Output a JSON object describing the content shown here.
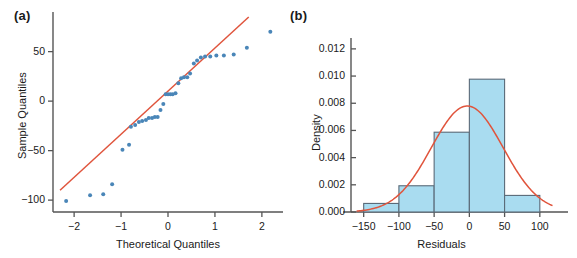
{
  "figure": {
    "background": "#ffffff",
    "panels": [
      {
        "label": "(a)"
      },
      {
        "label": "(b)"
      }
    ]
  },
  "colors": {
    "point": "#4a86b8",
    "line": "#e0543c",
    "bar_fill": "#a9dcf0",
    "bar_stroke": "#5a6a78",
    "axis": "#555555",
    "text": "#1a1a1a"
  },
  "chart_data": [
    {
      "type": "scatter",
      "panel": "(a)",
      "title": "",
      "xlabel": "Theoretical Quantiles",
      "ylabel": "Sample Quantiles",
      "xlim": [
        -2.45,
        2.45
      ],
      "ylim": [
        -112,
        88
      ],
      "xticks": [
        -2,
        -1,
        0,
        1,
        2
      ],
      "xtick_labels": [
        "−2",
        "−1",
        "0",
        "1",
        "2"
      ],
      "yticks": [
        -100,
        -50,
        0,
        50
      ],
      "ytick_labels": [
        "−100",
        "−50",
        "0",
        "50"
      ],
      "grid": false,
      "legend": "none",
      "x": [
        -2.17,
        -1.66,
        -1.38,
        -1.19,
        -0.97,
        -0.83,
        -0.79,
        -0.7,
        -0.62,
        -0.55,
        -0.47,
        -0.41,
        -0.34,
        -0.28,
        -0.22,
        -0.16,
        -0.1,
        -0.05,
        0.0,
        0.05,
        0.1,
        0.16,
        0.22,
        0.28,
        0.34,
        0.41,
        0.47,
        0.55,
        0.62,
        0.7,
        0.79,
        0.9,
        1.03,
        1.19,
        1.4,
        1.68,
        2.18
      ],
      "y": [
        -101,
        -95,
        -94,
        -84,
        -49,
        -44,
        -26,
        -24,
        -21,
        -20,
        -19,
        -17,
        -17,
        -16,
        -16,
        -9,
        -3,
        7,
        7,
        7,
        7,
        8,
        18,
        23,
        24,
        24,
        28,
        38,
        41,
        44,
        45,
        45,
        46,
        46,
        47,
        54,
        70
      ],
      "reference_line": {
        "name": "qq-reference-line",
        "x": [
          -2.3,
          1.72
        ],
        "y": [
          -90,
          85
        ]
      }
    },
    {
      "type": "bar",
      "subtype": "histogram",
      "panel": "(b)",
      "title": "",
      "xlabel": "Residuals",
      "ylabel": "Density",
      "xlim": [
        -168,
        140
      ],
      "ylim": [
        0,
        0.0128
      ],
      "xticks": [
        -150,
        -100,
        -50,
        0,
        50,
        100
      ],
      "xtick_labels": [
        "−150",
        "−100",
        "−50",
        "0",
        "50",
        "100"
      ],
      "yticks": [
        0.0,
        0.002,
        0.004,
        0.006,
        0.008,
        0.01,
        0.012
      ],
      "ytick_labels": [
        "0.000",
        "0.002",
        "0.004",
        "0.006",
        "0.008",
        "0.010",
        "0.012"
      ],
      "grid": false,
      "legend": "none",
      "bin_edges": [
        -150,
        -100,
        -50,
        0,
        50,
        100
      ],
      "categories": [
        "−150 to −100",
        "−100 to −50",
        "−50 to 0",
        "0 to 50",
        "50 to 100"
      ],
      "values": [
        0.00063,
        0.00193,
        0.00587,
        0.00977,
        0.00122
      ],
      "density_curve": {
        "name": "normal-density-curve",
        "mean": -3,
        "sd": 51,
        "peak": 0.0078
      }
    }
  ]
}
